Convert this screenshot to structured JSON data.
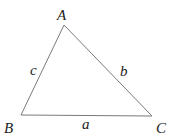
{
  "diagram": {
    "type": "triangle",
    "vertices": [
      {
        "name": "A",
        "label": "A"
      },
      {
        "name": "B",
        "label": "B"
      },
      {
        "name": "C",
        "label": "C"
      }
    ],
    "sides": [
      {
        "name": "a",
        "label": "a",
        "between": [
          "B",
          "C"
        ]
      },
      {
        "name": "b",
        "label": "b",
        "between": [
          "A",
          "C"
        ]
      },
      {
        "name": "c",
        "label": "c",
        "between": [
          "A",
          "B"
        ]
      }
    ],
    "colors": {
      "edge": "#7a7a7a",
      "text": "#222222",
      "background": "#ffffff"
    }
  }
}
